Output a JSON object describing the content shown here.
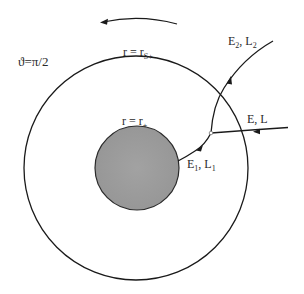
{
  "diagram": {
    "type": "penrose-process-schematic",
    "labels": {
      "theta": "ϑ=π/2",
      "ergosphere_r": "r = r",
      "ergosphere_sub": "S+",
      "horizon_r": "r = r",
      "horizon_sub": "+",
      "incoming_E": "E",
      "incoming_sep": ", ",
      "incoming_L": "L",
      "escaping_E": "E",
      "escaping_E_sub": "2",
      "escaping_sep": ", ",
      "escaping_L": "L",
      "escaping_L_sub": "2",
      "infalling_E": "E",
      "infalling_E_sub": "1",
      "infalling_sep": ", ",
      "infalling_L": "L",
      "infalling_L_sub": "1"
    },
    "elements": {
      "outer_circle": {
        "name": "ergosphere boundary",
        "cx": 136,
        "cy": 168,
        "r": 112
      },
      "inner_disk": {
        "name": "event horizon",
        "cx": 137,
        "cy": 168,
        "r": 42,
        "fill": "#9a9a9a"
      },
      "rotation_arrow": {
        "direction": "counter-clockwise"
      },
      "split_point": {
        "x": 211,
        "y": 133
      }
    },
    "colors": {
      "line": "#1a1a1a",
      "horizon_fill": "#9a9a9a",
      "background": "#ffffff"
    }
  }
}
